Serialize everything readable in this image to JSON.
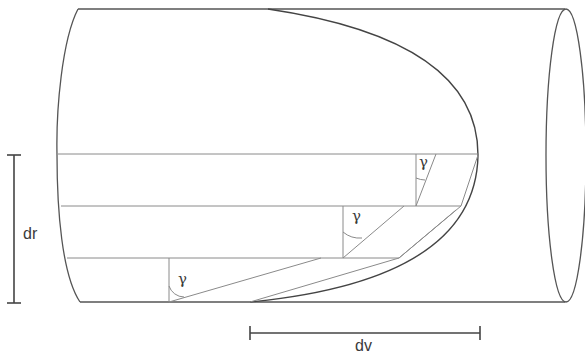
{
  "diagram": {
    "type": "velocity-profile-in-pipe",
    "labels": {
      "radial_increment": "dr",
      "velocity_increment": "dv",
      "angle_1": "γ",
      "angle_2": "γ",
      "angle_3": "γ"
    },
    "colors": {
      "stroke": "#555555",
      "thin_stroke": "#8a8a8a",
      "text": "#3a3a3a",
      "background": "#ffffff"
    },
    "elements": [
      "cylinder-body",
      "cylinder-end-ellipse",
      "parabolic-velocity-profile",
      "layer-lines",
      "shear-triangles",
      "dr-dimension",
      "dv-dimension"
    ]
  }
}
